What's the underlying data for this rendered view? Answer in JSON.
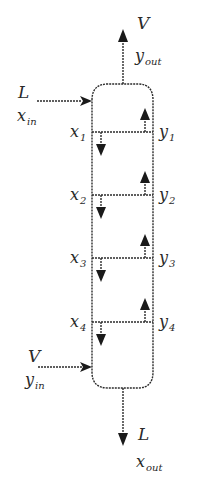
{
  "diagram": {
    "colors": {
      "stroke": "#2b2b2b",
      "text": "#2a2a2a",
      "background": "#ffffff"
    },
    "column": {
      "stages": 4
    },
    "streams": {
      "liquid_in": {
        "flow": "L",
        "comp": "x",
        "sub": "in"
      },
      "vapor_out": {
        "flow": "V",
        "comp": "y",
        "sub": "out"
      },
      "vapor_in": {
        "flow": "V",
        "comp": "y",
        "sub": "in"
      },
      "liquid_out": {
        "flow": "L",
        "comp": "x",
        "sub": "out"
      }
    },
    "stages": [
      {
        "x": "x",
        "x_sub": "1",
        "y": "y",
        "y_sub": "1"
      },
      {
        "x": "x",
        "x_sub": "2",
        "y": "y",
        "y_sub": "2"
      },
      {
        "x": "x",
        "x_sub": "3",
        "y": "y",
        "y_sub": "3"
      },
      {
        "x": "x",
        "x_sub": "4",
        "y": "y",
        "y_sub": "4"
      }
    ]
  }
}
